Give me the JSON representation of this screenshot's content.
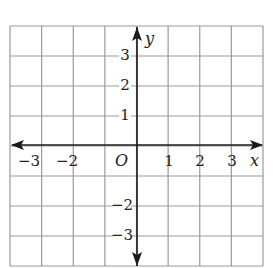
{
  "diagram": {
    "type": "coordinate-plane",
    "grid": {
      "x_min": -4,
      "x_max": 4,
      "y_min": -4,
      "y_max": 4,
      "line_color": "#9a9a9a",
      "axis_color": "#1a1a1a"
    },
    "axes": {
      "x_label": "x",
      "y_label": "y",
      "origin_label": "O"
    },
    "x_ticks": [
      {
        "value": -3,
        "label": "−3"
      },
      {
        "value": -2,
        "label": "−2"
      },
      {
        "value": 1,
        "label": "1"
      },
      {
        "value": 2,
        "label": "2"
      },
      {
        "value": 3,
        "label": "3"
      }
    ],
    "y_ticks": [
      {
        "value": 3,
        "label": "3"
      },
      {
        "value": 2,
        "label": "2"
      },
      {
        "value": 1,
        "label": "1"
      },
      {
        "value": -2,
        "label": "−2"
      },
      {
        "value": -3,
        "label": "−3"
      }
    ]
  }
}
